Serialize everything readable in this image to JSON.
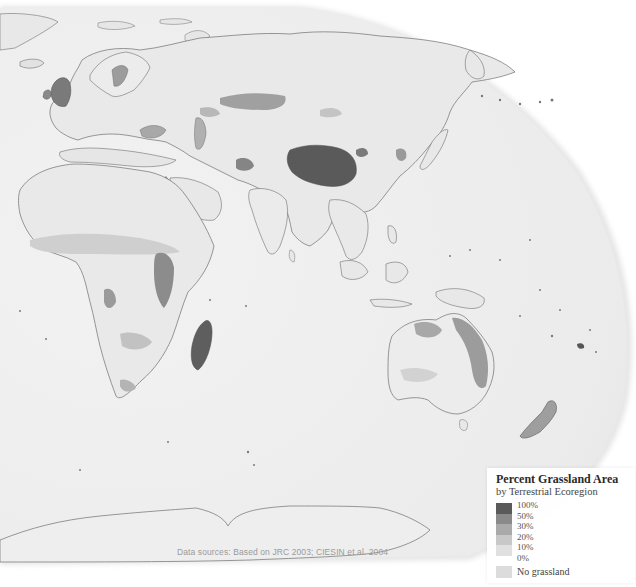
{
  "map": {
    "type": "choropleth",
    "theme": "Percent grassland area by terrestrial ecoregion",
    "projection_view": "Eastern hemisphere (Europe, Africa, Asia, Oceania, Antarctica)",
    "ocean_color": "#ececec",
    "land_base_color": "#e4e4e4",
    "border_color": "#6e6e6e",
    "highlighted_regions": [
      {
        "name": "Tibetan Plateau",
        "class": "100%"
      },
      {
        "name": "Madagascar",
        "class": "100%"
      },
      {
        "name": "British Isles",
        "class": "50%"
      },
      {
        "name": "Kazakh Steppe",
        "class": "50%"
      },
      {
        "name": "East African highlands",
        "class": "50%"
      },
      {
        "name": "Eastern Australia",
        "class": "30%"
      },
      {
        "name": "New Zealand",
        "class": "50%"
      },
      {
        "name": "Fiji",
        "class": "100%"
      }
    ]
  },
  "legend": {
    "title": "Percent Grassland Area",
    "subtitle": "by Terrestrial Ecoregion",
    "stops": [
      {
        "label": "100%",
        "color": "#5a5a5a"
      },
      {
        "label": "50%",
        "color": "#8a8a8a"
      },
      {
        "label": "30%",
        "color": "#aaaaaa"
      },
      {
        "label": "20%",
        "color": "#c8c8c8"
      },
      {
        "label": "10%",
        "color": "#e0e0e0"
      },
      {
        "label": "0%",
        "color": "#f4f4f4"
      }
    ],
    "no_data": {
      "label": "No grassland",
      "color": "#dcdcdc"
    }
  },
  "credit": "Data sources: Based on JRC 2003; CIESIN et al. 2004"
}
